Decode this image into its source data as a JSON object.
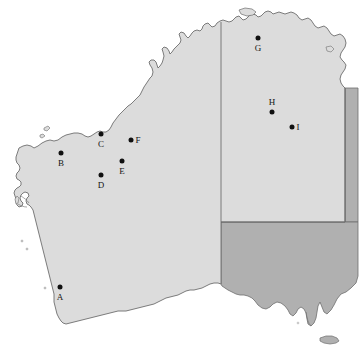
{
  "map": {
    "title": "Western Australia and central Australia locator map",
    "width": 363,
    "height": 360,
    "background_color": "#ffffff",
    "regions": [
      {
        "name": "Western Australia",
        "fill_color": "#dcdcdc",
        "stroke_color": "#6e6e6e"
      },
      {
        "name": "Northern Territory",
        "fill_color": "#dcdcdc",
        "stroke_color": "#6e6e6e"
      },
      {
        "name": "South Australia",
        "fill_color": "#b0b0b0",
        "stroke_color": "#6e6e6e"
      },
      {
        "name": "Queensland edge strip",
        "fill_color": "#b0b0b0",
        "stroke_color": "#6e6e6e"
      }
    ],
    "marker_style": {
      "dot_color": "#101010",
      "dot_radius_px": 2.5,
      "label_color": "#141414",
      "label_font_size_px": 9
    },
    "markers": [
      {
        "id": "A",
        "label": "A",
        "x": 60,
        "y": 287,
        "label_position": "below"
      },
      {
        "id": "B",
        "label": "B",
        "x": 61,
        "y": 153,
        "label_position": "below"
      },
      {
        "id": "C",
        "label": "C",
        "x": 101,
        "y": 134,
        "label_position": "below"
      },
      {
        "id": "D",
        "label": "D",
        "x": 101,
        "y": 175,
        "label_position": "below"
      },
      {
        "id": "E",
        "label": "E",
        "x": 122,
        "y": 161,
        "label_position": "below"
      },
      {
        "id": "F",
        "label": "F",
        "x": 131,
        "y": 140,
        "label_position": "right"
      },
      {
        "id": "G",
        "label": "G",
        "x": 258,
        "y": 38,
        "label_position": "below"
      },
      {
        "id": "H",
        "label": "H",
        "x": 272,
        "y": 112,
        "label_position": "above"
      },
      {
        "id": "I",
        "label": "I",
        "x": 292,
        "y": 127,
        "label_position": "right"
      }
    ]
  }
}
